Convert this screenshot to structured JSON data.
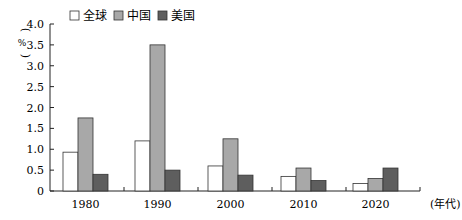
{
  "chart_data": {
    "type": "bar",
    "title": "",
    "xlabel": "(年代)",
    "ylabel": "(%)",
    "ylim": [
      0,
      4.0
    ],
    "yticks": [
      "0",
      "0.5",
      "1.0",
      "1.5",
      "2.0",
      "2.5",
      "3.0",
      "3.5",
      "4.0"
    ],
    "categories": [
      "1980",
      "1990",
      "2000",
      "2010",
      "2020"
    ],
    "series": [
      {
        "name": "全球",
        "color": "#ffffff",
        "values": [
          0.93,
          1.2,
          0.6,
          0.35,
          0.18
        ]
      },
      {
        "name": "中国",
        "color": "#a8a8a8",
        "values": [
          1.75,
          3.5,
          1.25,
          0.55,
          0.3
        ]
      },
      {
        "name": "美国",
        "color": "#5e5e5e",
        "values": [
          0.4,
          0.5,
          0.38,
          0.25,
          0.55
        ]
      }
    ],
    "legend_position": "top",
    "grid": false
  }
}
